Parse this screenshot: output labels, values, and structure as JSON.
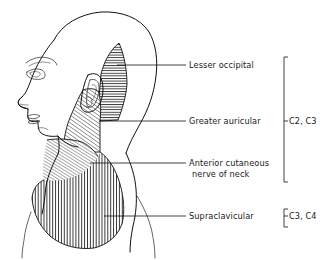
{
  "figure": {
    "background_color": "#ffffff",
    "ink_color": "#111111",
    "width": 324,
    "height": 260
  },
  "labels": [
    {
      "id": "lesser-occipital",
      "text": "Lesser occipital",
      "x": 189,
      "y": 68,
      "leader_from_x": 186,
      "leader_from_y": 65,
      "leader_to_x": 117,
      "leader_to_y": 65,
      "hatch": "horizontal"
    },
    {
      "id": "greater-auricular",
      "text": "Greater auricular",
      "x": 189,
      "y": 124,
      "leader_from_x": 186,
      "leader_from_y": 121,
      "leader_to_x": 99,
      "leader_to_y": 121,
      "hatch": "diagonal-right"
    },
    {
      "id": "anterior-cutaneous-nerve-of-neck",
      "text": "Anterior cutaneous",
      "text_line2": "nerve of neck",
      "x": 189,
      "y": 166,
      "y2": 177,
      "leader_from_x": 186,
      "leader_from_y": 163,
      "leader_to_x": 90,
      "leader_to_y": 163,
      "hatch": "diagonal-right-fine"
    },
    {
      "id": "supraclavicular",
      "text": "Supraclavicular",
      "x": 189,
      "y": 219,
      "leader_from_x": 186,
      "leader_from_y": 216,
      "leader_to_x": 104,
      "leader_to_y": 216,
      "hatch": "vertical"
    }
  ],
  "root_brackets": [
    {
      "id": "c2-c3",
      "text": "C2, C3",
      "text_x": 289,
      "text_y": 124,
      "bracket_x": 284,
      "bracket_top": 57,
      "bracket_bottom": 182,
      "tick_length": 4,
      "covers": [
        "lesser-occipital",
        "greater-auricular",
        "anterior-cutaneous-nerve-of-neck"
      ]
    },
    {
      "id": "c3-c4",
      "text": "C3, C4",
      "text_x": 289,
      "text_y": 219,
      "bracket_x": 284,
      "bracket_top": 209,
      "bracket_bottom": 227,
      "tick_length": 4,
      "covers": [
        "supraclavicular"
      ]
    }
  ],
  "anatomy": {
    "head_label": "lateral-head-profile",
    "features": [
      "skull",
      "forehead",
      "eye",
      "nose",
      "lips",
      "chin",
      "jaw",
      "ear",
      "neck",
      "shoulder"
    ]
  }
}
